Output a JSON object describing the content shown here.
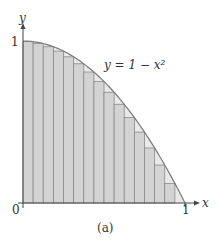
{
  "figure": {
    "caption": "(a)",
    "function_label": "y = 1 − x²",
    "x_axis_label": "x",
    "y_axis_label": "y",
    "x_ticks": [
      "0",
      "1"
    ],
    "y_ticks": [
      "1"
    ],
    "colors": {
      "rect_fill": "#d3d3d3",
      "rect_stroke": "#8a8a8a",
      "curve": "#7a7a7a",
      "axis": "#444444",
      "gap_fill": "#e9e9e9"
    }
  },
  "chart_data": {
    "type": "area",
    "title": "",
    "function": "y = 1 - x^2",
    "method": "lower Riemann sum (inscribed rectangles, right endpoints)",
    "n_rectangles": 16,
    "xlim": [
      0,
      1
    ],
    "ylim": [
      0,
      1
    ],
    "rect_heights": [
      0.9961,
      0.9844,
      0.9648,
      0.9375,
      0.9023,
      0.8594,
      0.8086,
      0.75,
      0.6836,
      0.6094,
      0.5273,
      0.4375,
      0.3398,
      0.2344,
      0.1211,
      0.0
    ],
    "xlabel": "x",
    "ylabel": "y",
    "caption": "(a)"
  }
}
